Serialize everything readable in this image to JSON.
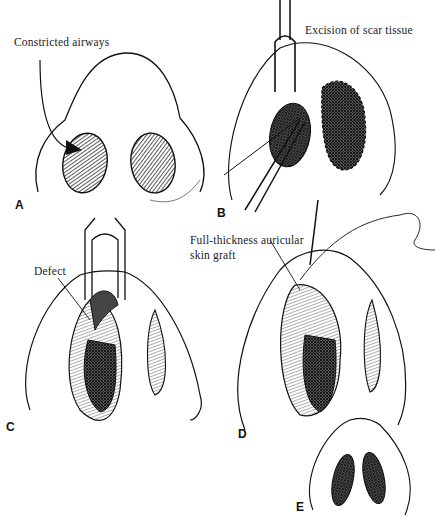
{
  "figure": {
    "panels": [
      {
        "id": "A",
        "letter": "A",
        "caption": "Constricted airways"
      },
      {
        "id": "B",
        "letter": "B",
        "caption": "Excision of scar tissue"
      },
      {
        "id": "C",
        "letter": "C",
        "caption": "Defect"
      },
      {
        "id": "D",
        "letter": "D",
        "caption_line1": "Full-thickness auricular",
        "caption_line2": "skin graft"
      },
      {
        "id": "E",
        "letter": "E"
      }
    ]
  }
}
